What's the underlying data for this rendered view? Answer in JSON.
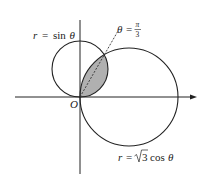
{
  "diagram": {
    "type": "polar-curves",
    "curves": [
      {
        "id": "small-circle",
        "equation_label": "r = sin θ",
        "r_var": "r",
        "eq": "=",
        "func": "sin",
        "var": "θ"
      },
      {
        "id": "large-circle",
        "equation_label": "r = √3 cos θ",
        "r_var": "r",
        "eq": "=",
        "coef": "3",
        "func": "cos",
        "var": "θ"
      }
    ],
    "ray": {
      "label": "θ = π/3",
      "theta": "θ",
      "eq": "=",
      "num": "π",
      "den": "3",
      "style": "dashed"
    },
    "origin_label": "O",
    "shaded_region": "intersection of r = sin θ and r = √3 cos θ",
    "colors": {
      "stroke": "#222222",
      "shade": "#b0b0b0",
      "background": "#ffffff"
    }
  }
}
